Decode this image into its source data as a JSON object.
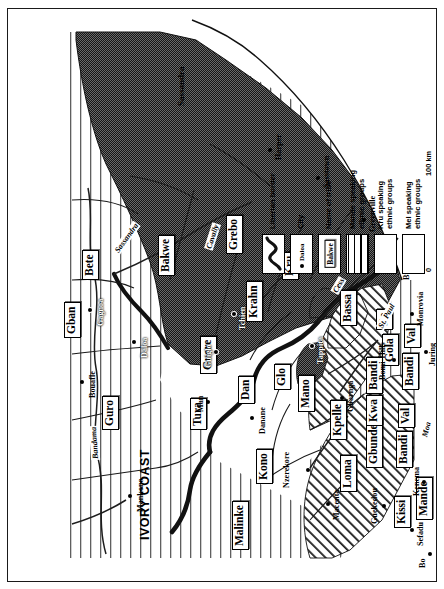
{
  "map": {
    "title": "Ethnic groups of Liberia and neighbouring regions",
    "countries": [
      {
        "name": "IVORY COAST"
      }
    ],
    "tribes": [
      {
        "label": "Malinke"
      },
      {
        "label": "Kono"
      },
      {
        "label": "Tura"
      },
      {
        "label": "Guro"
      },
      {
        "label": "Gban"
      },
      {
        "label": "Bete"
      },
      {
        "label": "Guere"
      },
      {
        "label": "Dan"
      },
      {
        "label": "Mano"
      },
      {
        "label": "Glo"
      },
      {
        "label": "Bakwe"
      },
      {
        "label": "Krahn"
      },
      {
        "label": "Grebo"
      },
      {
        "label": "Kru"
      },
      {
        "label": "Bassa"
      },
      {
        "label": "Kpelle"
      },
      {
        "label": "Loma"
      },
      {
        "label": "Gbunde"
      },
      {
        "label": "Kwa"
      },
      {
        "label": "Bandi"
      },
      {
        "label": "Bandi"
      },
      {
        "label": "Bandi"
      },
      {
        "label": "Kissi"
      },
      {
        "label": "Mande"
      },
      {
        "label": "Val"
      },
      {
        "label": "Val"
      },
      {
        "label": "Gola"
      },
      {
        "label": "De"
      }
    ],
    "cities": [
      {
        "name": "Mankono"
      },
      {
        "name": "Bouafle"
      },
      {
        "name": "Gagnoa"
      },
      {
        "name": "Daloa"
      },
      {
        "name": "Man"
      },
      {
        "name": "Guiglo"
      },
      {
        "name": "Danane"
      },
      {
        "name": "Nzerekore"
      },
      {
        "name": "Macenta"
      },
      {
        "name": "Guekedou"
      },
      {
        "name": "Sefadu"
      },
      {
        "name": "Kenema"
      },
      {
        "name": "Bo"
      },
      {
        "name": "Gbarnga"
      },
      {
        "name": "Bomi-Hills"
      },
      {
        "name": "Monrovia"
      },
      {
        "name": "Buchanan"
      },
      {
        "name": "Greenville"
      },
      {
        "name": "Sasstown"
      },
      {
        "name": "Harper"
      },
      {
        "name": "Tappita"
      },
      {
        "name": "Tchien"
      },
      {
        "name": "Juring"
      }
    ],
    "rivers": [
      {
        "name": "Bandama"
      },
      {
        "name": "Sassandra"
      },
      {
        "name": "Cavally"
      },
      {
        "name": "Moa"
      },
      {
        "name": "Cess"
      },
      {
        "name": "St. Paul"
      }
    ],
    "coast_labels": [
      {
        "name": "Sassandra"
      }
    ]
  },
  "legend": {
    "rows": [
      {
        "key": "liberian-border",
        "label": "Liberian border",
        "swatch": "border-line"
      },
      {
        "key": "city",
        "label": "City",
        "swatch": "city-dot",
        "sample_city": "Daloa"
      },
      {
        "key": "name-of-tribe",
        "label": "Name of tribe",
        "swatch": "tribe-box",
        "sample_tribe": "Bakwe"
      },
      {
        "key": "mande",
        "label": "Mande speaking\nethnic groups",
        "swatch": "mande"
      },
      {
        "key": "kru",
        "label": "Kru speaking\nethnic groups",
        "swatch": "kru"
      },
      {
        "key": "mel",
        "label": "Mel speaking\nethnic groups",
        "swatch": "mel"
      }
    ],
    "scale": {
      "start": "0",
      "end": "100 km"
    }
  },
  "colors": {
    "ink": "#000000",
    "paper": "#ffffff",
    "kru_fill": "#4a4a4a",
    "mande_rule": "#6d6d6d"
  }
}
